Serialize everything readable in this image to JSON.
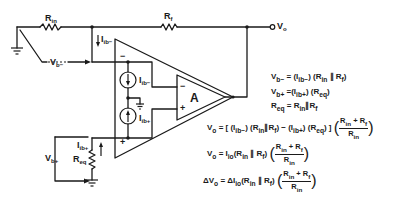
{
  "diagram": {
    "components": {
      "r_in": {
        "label": "R",
        "sub": "in"
      },
      "r_f": {
        "label": "R",
        "sub": "f"
      },
      "r_eq": {
        "label": "R",
        "sub": "eq"
      },
      "amp": {
        "label": "A"
      },
      "output": {
        "label": "V",
        "sub": "o"
      },
      "v_b_minus": {
        "label": "V",
        "sub": "b−"
      },
      "v_b_plus": {
        "label": "V",
        "sub": "b+"
      },
      "i_b_minus_wire": {
        "label": "I",
        "sub": "ib−"
      },
      "i_b_minus_src": {
        "label": "I",
        "sub": "ib−"
      },
      "i_b_plus_src": {
        "label": "I",
        "sub": "ib+"
      },
      "i_b_plus_wire": {
        "label": "I",
        "sub": "ib+"
      },
      "inv_sign": "−",
      "noninv_sign": "+",
      "inner_inv_sign": "−",
      "inner_noninv_sign": "+"
    },
    "colors": {
      "ink": "#1a1a1a",
      "background": "#ffffff"
    }
  },
  "equations": [
    "Vb− = (Ib−)(Rin ∥ Rf)",
    "Vb+ = (Ib+)(Req)",
    "Req = Rin ∥ Rf",
    "Vo = [ (Ib−)(Rin ∥ Rf) − (Ib+)(Req) ] ((Rin + Rf) / Rin)",
    "Vo = Iio(Rin ∥ Rf)((Rin + Rf) / Rin)",
    "ΔVo = ΔIio(Rin ∥ Rf)((Rin + Rf) / Rin)"
  ],
  "eq_parts": {
    "e1_lhs": "V",
    "e1_lhs_sub": "b−",
    "e1_rhs": "= (I",
    "e1_rhs_sub": "ib−",
    "e1_rest": ") (R",
    "e1_rsub": "in",
    "e1_par": " ∥ R",
    "e1_fsub": "f",
    "e1_close": ")",
    "e2_lhs": "V",
    "e2_lhs_sub": "b+",
    "e2_rhs": " =(I",
    "e2_rhs_sub": "ib+",
    "e2_rest": ") (R",
    "e2_rsub": "eq",
    "e2_close": ")",
    "e3_lhs": "R",
    "e3_lhs_sub": "eq",
    "e3_rhs": " = R",
    "e3_rsub": "in",
    "e3_par": "∥R",
    "e3_fsub": "f",
    "e4_text": "V",
    "e4_sub": "o",
    "e4_body": " = [ (I",
    "e4_s1": "ib−",
    "e4_b2": ") (R",
    "e4_s2": "in",
    "e4_b3": "∥R",
    "e4_s3": "f",
    "e4_b4": ") − (I",
    "e4_s4": "ib+",
    "e4_b5": ") (R",
    "e4_s5": "eq",
    "e4_b6": ") ]",
    "frac_num": "R",
    "frac_num_sub1": "in",
    "frac_plus": " + R",
    "frac_num_sub2": "f",
    "frac_den": "R",
    "frac_den_sub": "in",
    "e5_text": "V",
    "e5_sub": "o",
    "e5_body": " = I",
    "e5_s1": "io",
    "e5_b2": "(R",
    "e5_s2": "in",
    "e5_b3": " ∥ R",
    "e5_s3": "f",
    "e5_b4": ")",
    "e6_text": "ΔV",
    "e6_sub": "o",
    "e6_body": " = ΔI",
    "e6_s1": "io",
    "e6_b2": "(R",
    "e6_s2": "in",
    "e6_b3": " ∥ R",
    "e6_s3": "f",
    "e6_b4": ")",
    "lparen": "(",
    "rparen": ")"
  }
}
